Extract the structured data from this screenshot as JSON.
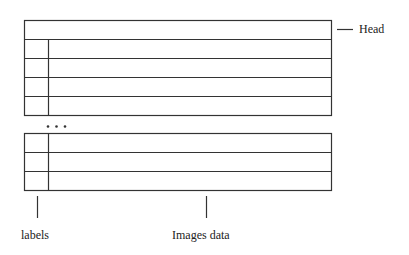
{
  "diagram": {
    "head_label": "Head",
    "labels_label": "labels",
    "images_data_label": "Images data",
    "ellipsis": "• • •",
    "top_block": {
      "head_rows": 1,
      "data_rows": 4
    },
    "bottom_block": {
      "data_rows": 3
    },
    "line_color": "#333333"
  }
}
